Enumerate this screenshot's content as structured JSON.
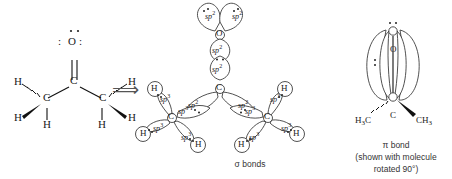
{
  "figure": {
    "background": "#ffffff",
    "ink": "#222222"
  },
  "lewis_structure": {
    "name": "acetone-lewis-structure",
    "carbonyl_oxygen": "O",
    "oxygen_lone_pair_left": ":",
    "oxygen_lone_pair_right": ":",
    "carbonyl_carbon": "C",
    "left_methyl_carbon": "C",
    "right_methyl_carbon": "C",
    "hydrogens": [
      "H",
      "H",
      "H",
      "H",
      "H",
      "H"
    ]
  },
  "arrow": {
    "name": "implies-arrow",
    "glyph": "⟹"
  },
  "sigma_diagram": {
    "caption": "σ bonds",
    "oxygen": {
      "label": "O",
      "lone_pair_orbitals": [
        {
          "label": "sp",
          "exp": "2"
        },
        {
          "label": "sp",
          "exp": "2"
        }
      ]
    },
    "carbonyl_carbon": {
      "label": "C",
      "orbitals": [
        {
          "label": "sp",
          "exp": "2"
        },
        {
          "label": "sp",
          "exp": "2"
        },
        {
          "label": "sp",
          "exp": "2"
        }
      ]
    },
    "oxygen_bonding_orbital": {
      "label": "sp",
      "exp": "2"
    },
    "left_methyl": {
      "label": "C",
      "orbitals": [
        {
          "label": "sp",
          "exp": "3"
        },
        {
          "label": "sp",
          "exp": "3"
        },
        {
          "label": "sp",
          "exp": "3"
        },
        {
          "label": "sp",
          "exp": "3"
        }
      ],
      "hydrogens": [
        "H",
        "H",
        "H"
      ]
    },
    "right_methyl": {
      "label": "C",
      "orbitals": [
        {
          "label": "sp",
          "exp": "3"
        },
        {
          "label": "sp",
          "exp": "3"
        },
        {
          "label": "sp",
          "exp": "3"
        },
        {
          "label": "sp",
          "exp": "3"
        }
      ],
      "hydrogens": [
        "H",
        "H",
        "H"
      ]
    }
  },
  "pi_diagram": {
    "oxygen": "O",
    "carbon": "C",
    "left_substituent": {
      "prefix": "H",
      "sub": "3",
      "suffix": "C"
    },
    "right_substituent": {
      "prefix": "CH",
      "sub": "3",
      "suffix": ""
    },
    "caption_line1": "π bond",
    "caption_line2": "(shown with molecule",
    "caption_line3": "rotated 90°)"
  }
}
